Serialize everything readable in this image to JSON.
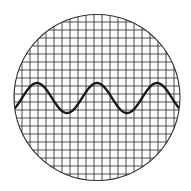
{
  "figure": {
    "title": "Oscilloscope screen with sine wave",
    "canvas": {
      "width": 191,
      "height": 191
    },
    "screen": {
      "shape": "circle",
      "center": [
        97,
        97.5
      ],
      "radius": 83,
      "border_color": "#333333",
      "background": "#ffffff"
    },
    "grid": {
      "spacing": 8,
      "origin": [
        14,
        14
      ],
      "line_color": "#3a3a3a",
      "line_width": 0.9
    },
    "waveform": {
      "type": "sine",
      "center_y": 98,
      "amplitude": 15,
      "period": 60,
      "peak_x": [
        37,
        96,
        156
      ],
      "trough_x": [
        67,
        127
      ],
      "x_start": 14,
      "x_end": 180,
      "stroke_color": "#1a1a1a",
      "stroke_width": 2.4
    }
  }
}
